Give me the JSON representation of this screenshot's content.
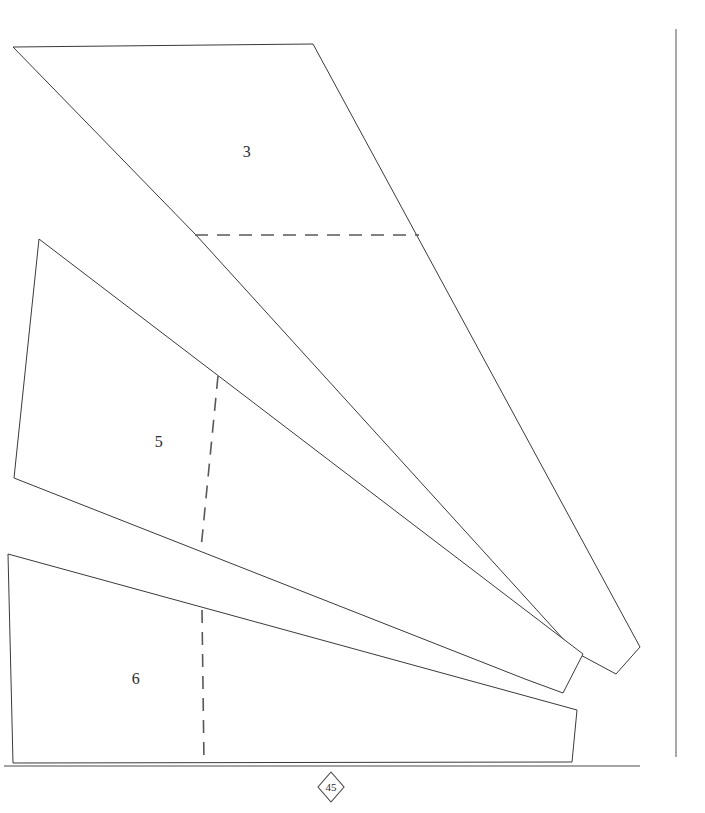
{
  "document": {
    "kind": "technical-pattern-drawing",
    "sheet_number": "45",
    "background_color": "#ffffff",
    "line_color": "#3a3a3a",
    "dashed_line_color": "#585858",
    "width": 705,
    "height": 813
  },
  "panels": [
    {
      "id": "panel-3",
      "label": "3",
      "label_x": 247,
      "label_y": 153,
      "outline": "13,47 313,44 640,647 616,674 575,652 196,235",
      "fold_line": "195,235 419,235"
    },
    {
      "id": "panel-5",
      "label": "5",
      "label_x": 159,
      "label_y": 443,
      "outline": "39,239 583,654 563,693 525,679 14,478",
      "fold_line": "218,376 201,549"
    },
    {
      "id": "panel-6",
      "label": "6",
      "label_x": 136,
      "label_y": 680,
      "outline": "8,554 577,710 572,762 13,763",
      "fold_line": "202,610 204,763"
    }
  ],
  "rules": {
    "right_margin": {
      "x": 676,
      "y1": 29,
      "y2": 757
    },
    "bottom_baseline": {
      "y": 766,
      "x1": 4,
      "x2": 640
    }
  },
  "sheet_marker": {
    "text": "45",
    "center_x": 331,
    "center_y": 787,
    "half_width": 13,
    "half_height": 15
  }
}
